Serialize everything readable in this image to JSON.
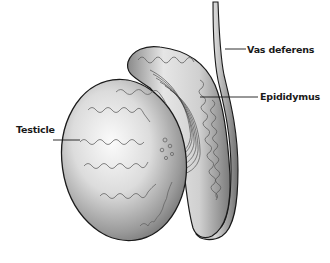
{
  "diagram": {
    "type": "anatomical-illustration",
    "labels": [
      {
        "id": "vas",
        "text": "Vas deferens"
      },
      {
        "id": "epi",
        "text": "Epididymus"
      },
      {
        "id": "test",
        "text": "Testicle"
      }
    ],
    "colors": {
      "background": "#ffffff",
      "outline": "#1a1a1a",
      "tubule": "#555555",
      "shade_dark": "#6e6e6e",
      "shade_light": "#f2f2f2"
    }
  }
}
